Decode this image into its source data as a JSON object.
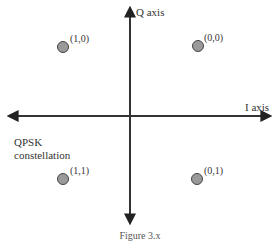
{
  "diagram": {
    "title": "QPSK constellation",
    "title_line1": "QPSK",
    "title_line2": "constellation",
    "axes": {
      "q_label": "Q axis",
      "i_label": "I axis"
    },
    "points": [
      {
        "label": "(1,0)",
        "quadrant": "top-left"
      },
      {
        "label": "(0,0)",
        "quadrant": "top-right"
      },
      {
        "label": "(1,1)",
        "quadrant": "bottom-left"
      },
      {
        "label": "(0,1)",
        "quadrant": "bottom-right"
      }
    ],
    "colors": {
      "axis": "#333333",
      "point_fill": "#9a9a9a",
      "point_stroke": "#444444"
    },
    "caption": "Figure 3.x"
  }
}
